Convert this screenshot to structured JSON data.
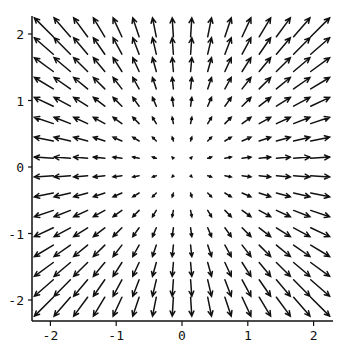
{
  "chart_data": {
    "type": "vector_field",
    "title": "",
    "xlabel": "",
    "ylabel": "",
    "field": "F(x, y) = (x, y)",
    "grid": {
      "nx": 16,
      "ny": 16,
      "xmin": -2.1,
      "xmax": 2.1,
      "ymin": -2.1,
      "ymax": 2.1
    },
    "xlim": [
      -2.25,
      2.25
    ],
    "ylim": [
      -2.3,
      2.25
    ],
    "x_ticks": [
      -2,
      -1,
      0,
      1,
      2
    ],
    "y_ticks": [
      -2,
      -1,
      0,
      1,
      2
    ],
    "x_tick_labels": [
      "-2",
      "-1",
      "0",
      "1",
      "2"
    ],
    "y_tick_labels": [
      "-2",
      "-1",
      "0",
      "1",
      "2"
    ],
    "axes": "left-bottom",
    "grid_lines": false,
    "arrow_color": "#111111"
  }
}
